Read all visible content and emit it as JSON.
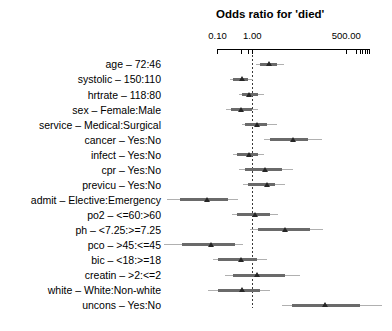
{
  "chart_data": {
    "type": "scatter",
    "subtype": "forest-plot",
    "title": "Odds ratio for 'died'",
    "xlabel": "Odds Ratio",
    "x_scale": "log",
    "xlim": [
      0.1,
      2250
    ],
    "grid": false,
    "reference_line": 1.0,
    "x_ticks": [
      {
        "value": 0.1,
        "label": "0.10"
      },
      {
        "value": 0.5,
        "label": ""
      },
      {
        "value": 0.75,
        "label": ""
      },
      {
        "value": 1,
        "label": "1.00"
      },
      {
        "value": 500,
        "label": "500.00"
      },
      {
        "value": 1000,
        "label": ""
      },
      {
        "value": 1250,
        "label": ""
      },
      {
        "value": 1500,
        "label": ""
      },
      {
        "value": 1750,
        "label": ""
      },
      {
        "value": 2000,
        "label": ""
      },
      {
        "value": 2250,
        "label": ""
      }
    ],
    "rows": [
      {
        "label": "age – 72:46",
        "estimate": 3.2,
        "ci_inner": [
          1.7,
          5.1
        ],
        "ci_outer": [
          1.3,
          7.9
        ]
      },
      {
        "label": "systolic – 150:110",
        "estimate": 0.52,
        "ci_inner": [
          0.28,
          0.77
        ],
        "ci_outer": [
          0.23,
          1.08
        ]
      },
      {
        "label": "hrtrate – 118:80",
        "estimate": 0.82,
        "ci_inner": [
          0.5,
          1.5
        ],
        "ci_outer": [
          0.4,
          2.1
        ]
      },
      {
        "label": "sex – Female:Male",
        "estimate": 0.5,
        "ci_inner": [
          0.24,
          0.96
        ],
        "ci_outer": [
          0.18,
          1.5
        ]
      },
      {
        "label": "service – Medical:Surgical",
        "estimate": 1.43,
        "ci_inner": [
          0.62,
          2.6
        ],
        "ci_outer": [
          0.5,
          5.0
        ]
      },
      {
        "label": "cancer – Yes:No",
        "estimate": 15.1,
        "ci_inner": [
          3.2,
          40
        ],
        "ci_outer": [
          2.1,
          99
        ]
      },
      {
        "label": "infect – Yes:No",
        "estimate": 0.82,
        "ci_inner": [
          0.36,
          1.5
        ],
        "ci_outer": [
          0.28,
          2.1
        ]
      },
      {
        "label": "cpr – Yes:No",
        "estimate": 2.4,
        "ci_inner": [
          0.62,
          7.0
        ],
        "ci_outer": [
          0.4,
          15
        ]
      },
      {
        "label": "previcu – Yes:No",
        "estimate": 2.7,
        "ci_inner": [
          0.77,
          4.5
        ],
        "ci_outer": [
          0.55,
          8.7
        ]
      },
      {
        "label": "admit – Elective:Emergency",
        "estimate": 0.051,
        "ci_inner": [
          0.0083,
          0.2
        ],
        "ci_outer": [
          0.0035,
          0.4
        ]
      },
      {
        "label": "po2 – <=60:>60",
        "estimate": 1.25,
        "ci_inner": [
          0.36,
          3.2
        ],
        "ci_outer": [
          0.26,
          5.6
        ]
      },
      {
        "label": "ph – <7.25:>=7.25",
        "estimate": 9.1,
        "ci_inner": [
          1.5,
          45
        ],
        "ci_outer": [
          0.86,
          110
        ]
      },
      {
        "label": "pco – >45:<=45",
        "estimate": 0.068,
        "ci_inner": [
          0.0093,
          0.32
        ],
        "ci_outer": [
          0.0028,
          0.55
        ]
      },
      {
        "label": "bic – <18:>=18",
        "estimate": 0.5,
        "ci_inner": [
          0.105,
          1.34
        ],
        "ci_outer": [
          0.076,
          2.6
        ]
      },
      {
        "label": "creatin – >2:<=2",
        "estimate": 1.43,
        "ci_inner": [
          0.28,
          8.7
        ],
        "ci_outer": [
          0.164,
          23
        ]
      },
      {
        "label": "white – White:Non-white",
        "estimate": 0.53,
        "ci_inner": [
          0.105,
          1.66
        ],
        "ci_outer": [
          0.054,
          3.2
        ]
      },
      {
        "label": "uncons – Yes:No",
        "estimate": 123,
        "ci_inner": [
          13.6,
          1240
        ],
        "ci_outer": [
          7.0,
          5200
        ]
      }
    ]
  },
  "colors": {
    "background": "#ffffff",
    "text": "#000000",
    "axis": "#000000",
    "ci_outer": "#b0b0b0",
    "ci_inner": "#6a6a6a",
    "marker": "#262626",
    "reference_line": "#3a3a3a"
  }
}
